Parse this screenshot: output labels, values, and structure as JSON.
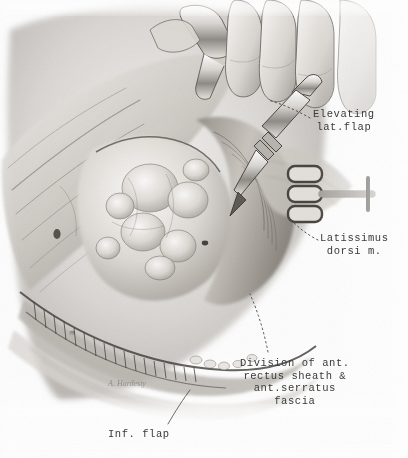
{
  "figure": {
    "medium": "pencil / carbon-dust grayscale medical illustration",
    "background_color": "#fdfdfd",
    "ink_color": "#3a3a38",
    "signature": "A. Hardesty"
  },
  "labels": [
    {
      "id": "elevating-lat-flap",
      "text": "Elevating\nlat.flap",
      "lines": [
        "Elevating",
        "lat.flap"
      ],
      "align": "center",
      "x": 313,
      "y": 108,
      "leader": "dotted",
      "points_to": "scalpel dissecting plane beneath elevated lateral flap"
    },
    {
      "id": "latissimus-dorsi-m",
      "text": "Latissimus\ndorsi m.",
      "lines": [
        "Latissimus",
        "dorsi m."
      ],
      "align": "center",
      "x": 320,
      "y": 232,
      "leader": "dotted",
      "points_to": "latissimus dorsi muscle belly at rake retractor"
    },
    {
      "id": "division-ant-rectus-sheath",
      "text": "Division of ant.\nrectus sheath &\nant.serratus\nfascia",
      "lines": [
        "Division of ant.",
        "rectus sheath &",
        "ant.serratus",
        "fascia"
      ],
      "align": "center",
      "x": 240,
      "y": 357,
      "leader": "dotted",
      "points_to": "incised fascial edge along inferior curve"
    },
    {
      "id": "inf-flap",
      "text": "Inf. flap",
      "lines": [
        "Inf. flap"
      ],
      "align": "left",
      "x": 108,
      "y": 428,
      "leader": "solid",
      "points_to": "inferior skin flap margin"
    }
  ],
  "anatomy": [
    {
      "name": "elevated-lateral-skin-flap",
      "region": "upper-left diagonal band"
    },
    {
      "name": "lobulated-subcutaneous-fat",
      "region": "central mass"
    },
    {
      "name": "latissimus-dorsi-muscle",
      "region": "right of center under retractor"
    },
    {
      "name": "anterior-rectus-sheath",
      "region": "lower curved fascial band"
    },
    {
      "name": "anterior-serratus-fascia",
      "region": "lower curved fascial band"
    },
    {
      "name": "inferior-skin-flap",
      "region": "bottom-left sweep"
    },
    {
      "name": "wound-edge-hatching",
      "region": "lower arc cut margin"
    }
  ],
  "instruments": [
    {
      "name": "scalpel",
      "region": "upper center, held in gloved fingers",
      "angle_deg": 38
    },
    {
      "name": "rake-retractor",
      "region": "right center, four prongs"
    },
    {
      "name": "retractor-blade",
      "region": "top center"
    },
    {
      "name": "surgeon-fingers",
      "region": "top right"
    }
  ]
}
